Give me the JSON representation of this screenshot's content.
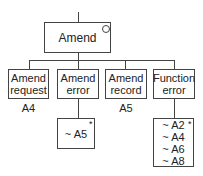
{
  "root": {
    "label": "Amend",
    "marker": "selection-circle"
  },
  "children": [
    {
      "line1": "Amend",
      "line2": "request",
      "below": "A4"
    },
    {
      "line1": "Amend",
      "line2": "error",
      "below": ""
    },
    {
      "line1": "Amend",
      "line2": "record",
      "below": "A5"
    },
    {
      "line1": "Function",
      "line2": "error",
      "below": ""
    }
  ],
  "leaves": {
    "amend_error": {
      "items": [
        "~ A5"
      ],
      "marker": "*"
    },
    "function_error": {
      "items": [
        "~ A2",
        "~ A4",
        "~ A6",
        "~ A8"
      ],
      "marker": "*"
    }
  }
}
